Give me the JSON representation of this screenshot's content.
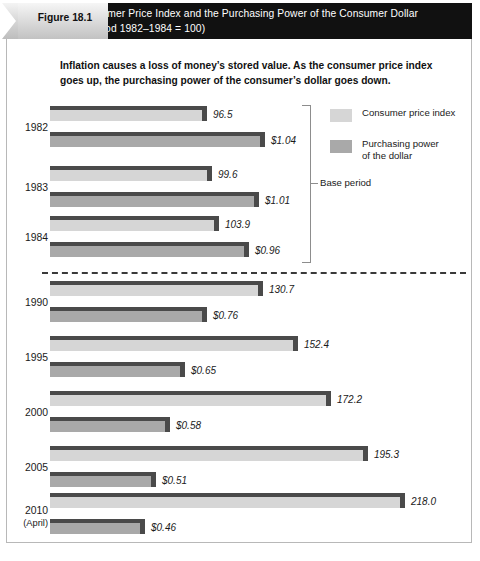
{
  "figure": {
    "tab_label": "Figure 18.1",
    "title_line1": "The Consumer Price Index and the Purchasing Power of the Consumer Dollar",
    "title_line2": "(Base Period 1982–1984 = 100)",
    "subtitle_line1": "Inflation causes a loss of money’s stored value. As the consumer price index",
    "subtitle_line2": "goes up, the purchasing power of the consumer’s dollar goes down."
  },
  "legend": {
    "cpi_label": "Consumer price index",
    "ppd_label_line1": "Purchasing power",
    "ppd_label_line2": "of the dollar"
  },
  "annotations": {
    "base_period": "Base period"
  },
  "colors": {
    "header_background": "#111111",
    "cpi_bar": "#d6d6d6",
    "ppd_bar": "#a9a9a9",
    "bar_shadow": "#4a4a4a",
    "text": "#1a1a1a",
    "frame": "#b8b8b8"
  },
  "chart_data": {
    "type": "bar",
    "title": "The Consumer Price Index and the Purchasing Power of the Consumer Dollar",
    "subtitle": "(Base Period 1982–1984 = 100)",
    "orientation": "horizontal",
    "grid": false,
    "legend_position": "top-right",
    "xlabel": "",
    "ylabel": "",
    "categories": [
      "1982",
      "1983",
      "1984",
      "1990",
      "1995",
      "2000",
      "2005",
      "2010 (April)"
    ],
    "series": [
      {
        "name": "Consumer price index",
        "key": "cpi",
        "values": [
          96.5,
          99.6,
          103.9,
          130.7,
          152.4,
          172.2,
          195.3,
          218.0
        ],
        "labels": [
          "96.5",
          "99.6",
          "103.9",
          "130.7",
          "152.4",
          "172.2",
          "195.3",
          "218.0"
        ],
        "color": "#d6d6d6"
      },
      {
        "name": "Purchasing power of the dollar",
        "key": "ppd",
        "values": [
          1.04,
          1.01,
          0.96,
          0.76,
          0.65,
          0.58,
          0.51,
          0.46
        ],
        "labels": [
          "$1.04",
          "$1.01",
          "$0.96",
          "$0.76",
          "$0.65",
          "$0.58",
          "$0.51",
          "$0.46"
        ],
        "color": "#a9a9a9"
      }
    ],
    "rows": [
      {
        "year": "1982",
        "year_sub": "",
        "cpi": 96.5,
        "cpi_label": "96.5",
        "ppd": 1.04,
        "ppd_label": "$1.04"
      },
      {
        "year": "1983",
        "year_sub": "",
        "cpi": 99.6,
        "cpi_label": "99.6",
        "ppd": 1.01,
        "ppd_label": "$1.01"
      },
      {
        "year": "1984",
        "year_sub": "",
        "cpi": 103.9,
        "cpi_label": "103.9",
        "ppd": 0.96,
        "ppd_label": "$0.96"
      },
      {
        "year": "1990",
        "year_sub": "",
        "cpi": 130.7,
        "cpi_label": "130.7",
        "ppd": 0.76,
        "ppd_label": "$0.76"
      },
      {
        "year": "1995",
        "year_sub": "",
        "cpi": 152.4,
        "cpi_label": "152.4",
        "ppd": 0.65,
        "ppd_label": "$0.65"
      },
      {
        "year": "2000",
        "year_sub": "",
        "cpi": 172.2,
        "cpi_label": "172.2",
        "ppd": 0.58,
        "ppd_label": "$0.58"
      },
      {
        "year": "2005",
        "year_sub": "",
        "cpi": 195.3,
        "cpi_label": "195.3",
        "ppd": 0.51,
        "ppd_label": "$0.51"
      },
      {
        "year": "2010",
        "year_sub": "(April)",
        "cpi": 218.0,
        "cpi_label": "218.0",
        "ppd": 0.46,
        "ppd_label": "$0.46"
      }
    ],
    "base_period_rows": [
      "1982",
      "1983",
      "1984"
    ]
  }
}
